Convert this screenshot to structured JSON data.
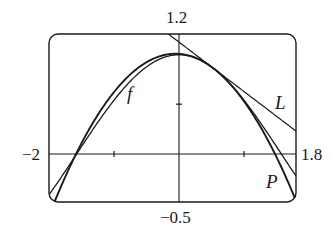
{
  "chart_data": {
    "type": "line",
    "title": "",
    "xlabel": "",
    "ylabel": "",
    "xlim": [
      -2,
      1.8
    ],
    "ylim": [
      -0.5,
      1.2
    ],
    "grid": false,
    "legend": "none (curves labeled inline)",
    "window_labels": {
      "xmin": "−2",
      "xmax": "1.8",
      "ymin": "−0.5",
      "ymax": "1.2"
    },
    "ticks": {
      "x": [
        -1,
        1
      ],
      "y": [
        0.5
      ]
    },
    "series": [
      {
        "name": "f",
        "label": "f",
        "expression": "cos(x)",
        "points": [
          [
            -2.0,
            -0.416
          ],
          [
            -1.5,
            0.071
          ],
          [
            -1.0,
            0.54
          ],
          [
            -0.5,
            0.878
          ],
          [
            0.0,
            1.0
          ],
          [
            0.5,
            0.878
          ],
          [
            1.0,
            0.54
          ],
          [
            1.5,
            0.071
          ],
          [
            1.8,
            -0.227
          ]
        ]
      },
      {
        "name": "L",
        "label": "L",
        "expression": "tangent line to f at x = π/6",
        "points": [
          [
            -0.12,
            1.2
          ],
          [
            0.0,
            1.128
          ],
          [
            0.524,
            0.866
          ],
          [
            1.8,
            0.228
          ]
        ]
      },
      {
        "name": "P",
        "label": "P",
        "expression": "quadratic approximation to f at x = π/6",
        "points": [
          [
            -1.92,
            -0.5
          ],
          [
            -1.5,
            0.053
          ],
          [
            -1.0,
            0.519
          ],
          [
            -0.5,
            0.852
          ],
          [
            0.0,
            1.069
          ],
          [
            0.524,
            0.866
          ],
          [
            1.0,
            0.542
          ],
          [
            1.5,
            0.102
          ],
          [
            1.8,
            -0.477
          ]
        ]
      }
    ],
    "annotations": [
      {
        "text": "f",
        "near": [
          -0.75,
          0.62
        ]
      },
      {
        "text": "L",
        "near": [
          1.55,
          0.45
        ]
      },
      {
        "text": "P",
        "near": [
          1.45,
          -0.3
        ]
      }
    ]
  },
  "labels": {
    "ymax": "1.2",
    "ymin": "−0.5",
    "xmin": "−2",
    "xmax": "1.8",
    "f": "f",
    "L": "L",
    "P": "P"
  },
  "style": {
    "ink": "#1a1a1a",
    "background": "#ffffff"
  }
}
